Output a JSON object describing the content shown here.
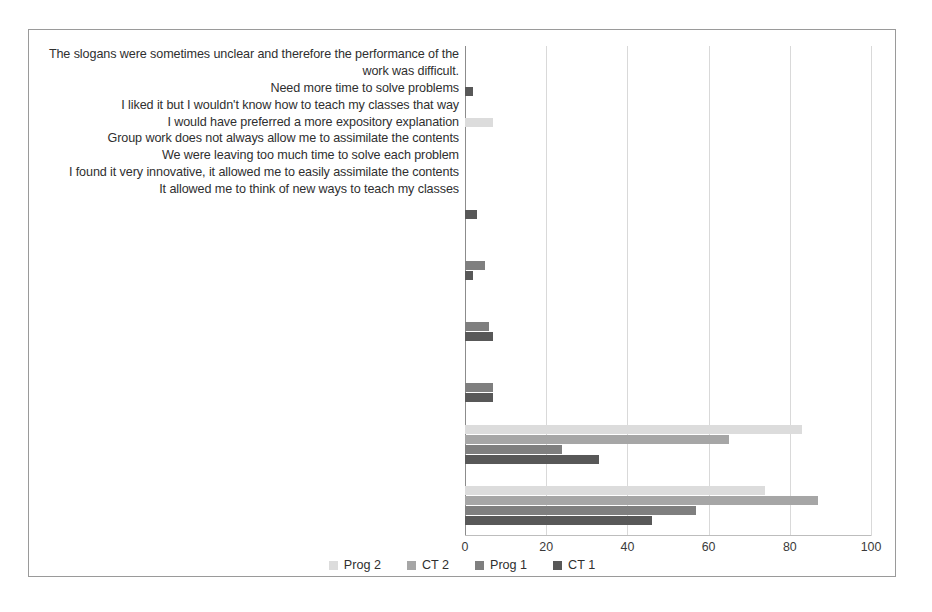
{
  "chart_data": {
    "type": "bar",
    "orientation": "horizontal",
    "title": "",
    "xlabel": "",
    "ylabel": "",
    "xlim": [
      0,
      100
    ],
    "xticks": [
      0,
      20,
      40,
      60,
      80,
      100
    ],
    "grid": true,
    "legend_position": "bottom",
    "categories": [
      "The slogans were sometimes unclear and therefore the performance of the work was difficult.",
      "Need more time to solve problems",
      "I liked it but I wouldn't know how to teach my classes that way",
      "I would have preferred a more expository explanation",
      "Group work does not always allow me to assimilate the contents",
      "We were leaving too much time to solve each problem",
      "I found it very innovative, it allowed me to easily assimilate the contents",
      "It allowed me to think of new ways to teach my classes"
    ],
    "series": [
      {
        "name": "Prog 2",
        "color": "#dcdcdc",
        "values": [
          0,
          7,
          0,
          0,
          0,
          0,
          83,
          74
        ]
      },
      {
        "name": "CT 2",
        "color": "#a6a6a6",
        "values": [
          0,
          0,
          0,
          0,
          0,
          0,
          65,
          87
        ]
      },
      {
        "name": "Prog 1",
        "color": "#7f7f7f",
        "values": [
          0,
          0,
          0,
          5,
          6,
          7,
          24,
          57
        ]
      },
      {
        "name": "CT 1",
        "color": "#585858",
        "values": [
          2,
          0,
          3,
          2,
          7,
          7,
          33,
          46
        ]
      }
    ]
  },
  "legend": {
    "items": [
      {
        "label": "Prog 2",
        "color": "#dcdcdc"
      },
      {
        "label": "CT 2",
        "color": "#a6a6a6"
      },
      {
        "label": "Prog 1",
        "color": "#7f7f7f"
      },
      {
        "label": "CT 1",
        "color": "#585858"
      }
    ]
  },
  "axis": {
    "tick_labels": [
      "0",
      "20",
      "40",
      "60",
      "80",
      "100"
    ]
  }
}
